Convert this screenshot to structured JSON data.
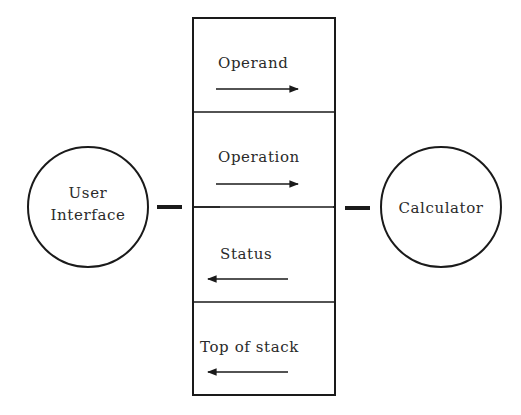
{
  "diagram": {
    "left_node": {
      "line1": "User",
      "line2": "Interface"
    },
    "right_node": {
      "label": "Calculator"
    },
    "interface_cells": [
      {
        "label": "Operand",
        "direction": "right"
      },
      {
        "label": "Operation",
        "direction": "right"
      },
      {
        "label": "Status",
        "direction": "left"
      },
      {
        "label": "Top of stack",
        "direction": "left"
      }
    ],
    "colors": {
      "line": "#1a1a1a",
      "text": "#2a2a2a",
      "background": "#ffffff"
    }
  }
}
